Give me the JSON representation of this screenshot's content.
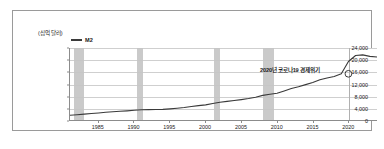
{
  "chart_data": {
    "type": "line",
    "title": "",
    "xlabel": "",
    "ylabel": "(십억 달러)",
    "ylim": [
      0,
      24000
    ],
    "xlim": [
      1981,
      2024
    ],
    "grid": true,
    "legend_position": "top-left",
    "y_ticks": [
      "0",
      "4,000",
      "8,000",
      "12,000",
      "16,000",
      "20,000",
      "24,000"
    ],
    "y_tick_values": [
      0,
      4000,
      8000,
      12000,
      16000,
      20000,
      24000
    ],
    "x_ticks": [
      "1985",
      "1990",
      "1995",
      "2000",
      "2005",
      "2010",
      "2015",
      "2020"
    ],
    "x_tick_values": [
      1985,
      1990,
      1995,
      2000,
      2005,
      2010,
      2015,
      2020
    ],
    "series": [
      {
        "name": "M2",
        "color": "#3a3a3a",
        "x": [
          1981,
          1982,
          1983,
          1984,
          1985,
          1986,
          1987,
          1988,
          1989,
          1990,
          1991,
          1992,
          1993,
          1994,
          1995,
          1996,
          1997,
          1998,
          1999,
          2000,
          2001,
          2002,
          2003,
          2004,
          2005,
          2006,
          2007,
          2008,
          2009,
          2010,
          2011,
          2012,
          2013,
          2014,
          2015,
          2016,
          2017,
          2018,
          2019,
          2020,
          2021,
          2022,
          2023,
          2024
        ],
        "values": [
          1600,
          1750,
          1950,
          2150,
          2350,
          2600,
          2750,
          2900,
          3050,
          3250,
          3400,
          3450,
          3500,
          3550,
          3700,
          3900,
          4150,
          4500,
          4800,
          5050,
          5500,
          5900,
          6200,
          6500,
          6800,
          7150,
          7600,
          8200,
          8600,
          8900,
          9700,
          10500,
          11100,
          11800,
          12500,
          13400,
          14000,
          14500,
          15400,
          19500,
          21500,
          21700,
          21200,
          21000
        ],
        "unit": "십억 달러"
      }
    ],
    "recession_bands": [
      {
        "name": "1981-82 경기침체",
        "start": 1981.5,
        "end": 1982.9
      },
      {
        "name": "1990-91 경기침체",
        "start": 1990.4,
        "end": 1991.2
      },
      {
        "name": "2001 경기침체",
        "start": 2001.1,
        "end": 2001.9
      },
      {
        "name": "2008-09 글로벌 금융위기",
        "start": 2007.9,
        "end": 2009.5
      }
    ],
    "annotations": [
      {
        "text": "2020년 코로나19 경제위기",
        "x": 2020,
        "y": 15400,
        "marker": "circle"
      }
    ]
  },
  "legend": {
    "items": [
      {
        "label": "M2",
        "color": "#3a3a3a"
      }
    ]
  },
  "axis": {
    "y_unit": "(십억 달러)"
  }
}
